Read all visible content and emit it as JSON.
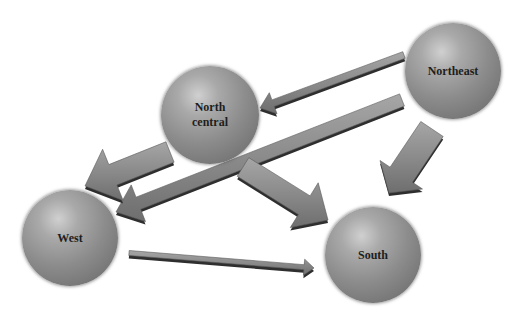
{
  "diagram": {
    "type": "migration-flow",
    "nodes": [
      {
        "id": "northeast",
        "label": "Northeast",
        "cx": 453,
        "cy": 71,
        "r": 48
      },
      {
        "id": "north_central",
        "label": "North\ncentral",
        "cx": 210,
        "cy": 115,
        "r": 49
      },
      {
        "id": "west",
        "label": "West",
        "cx": 70,
        "cy": 238,
        "r": 48
      },
      {
        "id": "south",
        "label": "South",
        "cx": 373,
        "cy": 255,
        "r": 48
      }
    ],
    "edges": [
      {
        "from": "northeast",
        "to": "north_central",
        "tail": [
          404,
          55
        ],
        "tip": [
          260,
          108
        ],
        "width": 7,
        "head": 14
      },
      {
        "from": "northeast",
        "to": "west",
        "tail": [
          402,
          100
        ],
        "tip": [
          116,
          212
        ],
        "width": 13,
        "head": 24
      },
      {
        "from": "northeast",
        "to": "south",
        "tail": [
          432,
          129
        ],
        "tip": [
          389,
          193
        ],
        "width": 27,
        "head": 22
      },
      {
        "from": "north_central",
        "to": "west",
        "tail": [
          170,
          152
        ],
        "tip": [
          85,
          186
        ],
        "width": 22,
        "head": 30
      },
      {
        "from": "north_central",
        "to": "south",
        "tail": [
          243,
          167
        ],
        "tip": [
          328,
          220
        ],
        "width": 22,
        "head": 28
      },
      {
        "from": "west",
        "to": "south",
        "tail": [
          129,
          253
        ],
        "tip": [
          314,
          268
        ],
        "width": 5,
        "head": 10
      }
    ]
  },
  "colors": {
    "arrow_fill": "#8a8a8a",
    "arrow_shadow": "#2e2e2e",
    "sphere_mid": "#8c8c8c",
    "label": "#1e1e1e"
  }
}
